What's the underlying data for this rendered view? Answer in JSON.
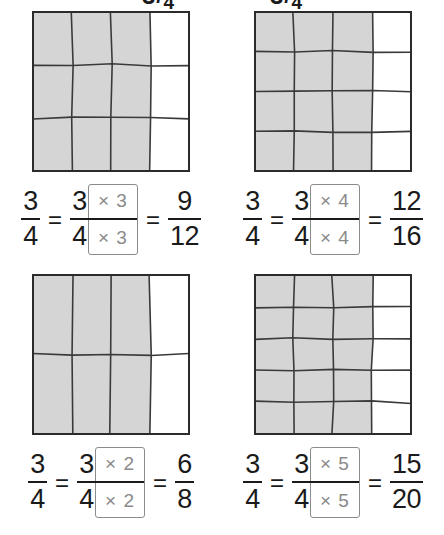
{
  "title_fraction": {
    "numerator": "3",
    "slash": "/",
    "denominator": "4"
  },
  "colors": {
    "shade": "#d5d5d5",
    "grid_line": "#3a3a3a",
    "border": "#2b2b2b",
    "mult_box": "#8b8b8b",
    "mult_text": "#8a8a8a",
    "text": "#1a1a1a"
  },
  "symbols": {
    "equals": "=",
    "times": "×"
  },
  "panels": [
    {
      "id": "panel-times-3",
      "grid": {
        "cols": 4,
        "rows": 3,
        "shaded_cols": 3,
        "total_cells": 12,
        "shaded_cells": 9
      },
      "equation": {
        "left": {
          "num": "3",
          "den": "4"
        },
        "base": {
          "num": "3",
          "den": "4"
        },
        "multiplier_top": "× 3",
        "multiplier_bottom": "× 3",
        "result": {
          "num": "9",
          "den": "12"
        }
      }
    },
    {
      "id": "panel-times-4",
      "grid": {
        "cols": 4,
        "rows": 4,
        "shaded_cols": 3,
        "total_cells": 16,
        "shaded_cells": 12
      },
      "equation": {
        "left": {
          "num": "3",
          "den": "4"
        },
        "base": {
          "num": "3",
          "den": "4"
        },
        "multiplier_top": "× 4",
        "multiplier_bottom": "× 4",
        "result": {
          "num": "12",
          "den": "16"
        }
      }
    },
    {
      "id": "panel-times-2",
      "grid": {
        "cols": 4,
        "rows": 2,
        "shaded_cols": 3,
        "total_cells": 8,
        "shaded_cells": 6
      },
      "equation": {
        "left": {
          "num": "3",
          "den": "4"
        },
        "base": {
          "num": "3",
          "den": "4"
        },
        "multiplier_top": "× 2",
        "multiplier_bottom": "× 2",
        "result": {
          "num": "6",
          "den": "8"
        }
      }
    },
    {
      "id": "panel-times-5",
      "grid": {
        "cols": 4,
        "rows": 5,
        "shaded_cols": 3,
        "total_cells": 20,
        "shaded_cells": 15
      },
      "equation": {
        "left": {
          "num": "3",
          "den": "4"
        },
        "base": {
          "num": "3",
          "den": "4"
        },
        "multiplier_top": "× 5",
        "multiplier_bottom": "× 5",
        "result": {
          "num": "15",
          "den": "20"
        }
      }
    }
  ]
}
